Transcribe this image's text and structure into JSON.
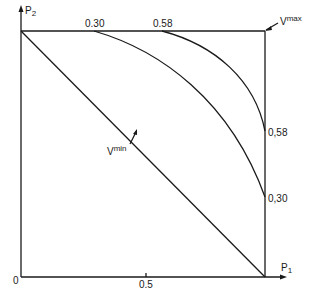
{
  "axes": {
    "x_label": "P",
    "x_sub": "1",
    "y_label": "P",
    "y_sub": "2",
    "origin_label": "0",
    "x_tick_label": "0.5"
  },
  "curves": {
    "vmin_label": "V",
    "vmin_sup": "min",
    "vmax_label": "V",
    "vmax_sup": "max",
    "c030_top": "0.30",
    "c058_top": "0.58",
    "c058_right": "0,58",
    "c030_right": "0,30"
  },
  "colors": {
    "line": "#1a1a1a",
    "background": "#ffffff"
  }
}
